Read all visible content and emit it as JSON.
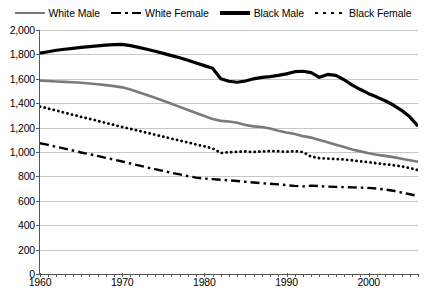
{
  "chart_data": {
    "type": "line",
    "title": "",
    "subtitle": "",
    "xlabel": "",
    "ylabel": "",
    "xlim": [
      1960,
      2006
    ],
    "ylim": [
      0,
      2000
    ],
    "grid": true,
    "legend_position": "top-center",
    "y_ticks": [
      "0",
      "200",
      "400",
      "600",
      "800",
      "1,000",
      "1,200",
      "1,400",
      "1,600",
      "1,800",
      "2,000"
    ],
    "y_tick_values": [
      0,
      200,
      400,
      600,
      800,
      1000,
      1200,
      1400,
      1600,
      1800,
      2000
    ],
    "x_ticks": [
      "1960",
      "1970",
      "1980",
      "1990",
      "2000"
    ],
    "x_tick_values": [
      1960,
      1970,
      1980,
      1990,
      2000
    ],
    "x": [
      1960,
      1961,
      1962,
      1963,
      1964,
      1965,
      1966,
      1967,
      1968,
      1969,
      1970,
      1971,
      1972,
      1973,
      1974,
      1975,
      1976,
      1977,
      1978,
      1979,
      1980,
      1981,
      1982,
      1983,
      1984,
      1985,
      1986,
      1987,
      1988,
      1989,
      1990,
      1991,
      1992,
      1993,
      1994,
      1995,
      1996,
      1997,
      1998,
      1999,
      2000,
      2001,
      2002,
      2003,
      2004,
      2005,
      2006
    ],
    "series": [
      {
        "name": "White Male",
        "color": "#7a7a7a",
        "style": "solid",
        "width": 2.6,
        "values": [
          1585,
          1582,
          1578,
          1575,
          1572,
          1568,
          1562,
          1556,
          1548,
          1540,
          1530,
          1512,
          1490,
          1468,
          1445,
          1420,
          1395,
          1370,
          1345,
          1320,
          1295,
          1270,
          1255,
          1250,
          1240,
          1222,
          1210,
          1205,
          1192,
          1175,
          1160,
          1148,
          1130,
          1118,
          1098,
          1080,
          1060,
          1040,
          1020,
          1005,
          990,
          978,
          968,
          958,
          945,
          932,
          920
        ]
      },
      {
        "name": "White Female",
        "color": "#000000",
        "style": "dashdot",
        "width": 2.4,
        "values": [
          1072,
          1058,
          1042,
          1028,
          1012,
          996,
          982,
          968,
          952,
          938,
          922,
          906,
          890,
          874,
          860,
          845,
          830,
          816,
          802,
          790,
          782,
          778,
          772,
          768,
          762,
          756,
          750,
          744,
          740,
          735,
          728,
          722,
          718,
          724,
          720,
          716,
          714,
          712,
          710,
          708,
          706,
          700,
          692,
          682,
          668,
          654,
          640
        ]
      },
      {
        "name": "Black Male",
        "color": "#000000",
        "style": "solid",
        "width": 3.2,
        "values": [
          1810,
          1822,
          1834,
          1842,
          1850,
          1858,
          1864,
          1870,
          1876,
          1880,
          1882,
          1872,
          1858,
          1842,
          1826,
          1808,
          1790,
          1772,
          1752,
          1730,
          1708,
          1686,
          1600,
          1580,
          1572,
          1582,
          1600,
          1612,
          1618,
          1628,
          1640,
          1658,
          1662,
          1650,
          1612,
          1636,
          1628,
          1592,
          1548,
          1512,
          1478,
          1450,
          1420,
          1385,
          1342,
          1288,
          1212
        ]
      },
      {
        "name": "Black Female",
        "color": "#000000",
        "style": "dotted",
        "width": 2.8,
        "values": [
          1372,
          1356,
          1340,
          1322,
          1305,
          1288,
          1272,
          1256,
          1238,
          1222,
          1205,
          1190,
          1174,
          1158,
          1142,
          1126,
          1110,
          1094,
          1078,
          1062,
          1046,
          1030,
          992,
          998,
          1002,
          1004,
          1000,
          1004,
          1008,
          1006,
          1002,
          1006,
          1000,
          962,
          950,
          946,
          942,
          938,
          932,
          924,
          916,
          908,
          900,
          892,
          882,
          868,
          852
        ]
      }
    ]
  },
  "legend": {
    "items": [
      {
        "label": "White Male",
        "swatch": "sw-solid-gray"
      },
      {
        "label": "White Female",
        "swatch": "sw-dashdot"
      },
      {
        "label": "Black Male",
        "swatch": "sw-solid-black"
      },
      {
        "label": "Black Female",
        "swatch": "sw-dotted"
      }
    ]
  }
}
